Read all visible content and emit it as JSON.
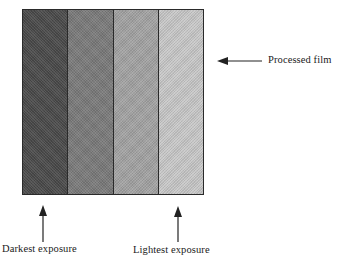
{
  "diagram": {
    "type": "film exposure strips",
    "film_label": "Processed film",
    "strips": [
      {
        "name": "strip-1",
        "shade": "#4a4a4a"
      },
      {
        "name": "strip-2",
        "shade": "#7a7a7a"
      },
      {
        "name": "strip-3",
        "shade": "#a3a3a3"
      },
      {
        "name": "strip-4",
        "shade": "#c8c8c8"
      }
    ],
    "annotations": {
      "darkest": "Darkest exposure",
      "lightest": "Lightest exposure"
    },
    "colors": {
      "border": "#2a2a2a",
      "arrow": "#222222",
      "background": "#ffffff"
    }
  }
}
